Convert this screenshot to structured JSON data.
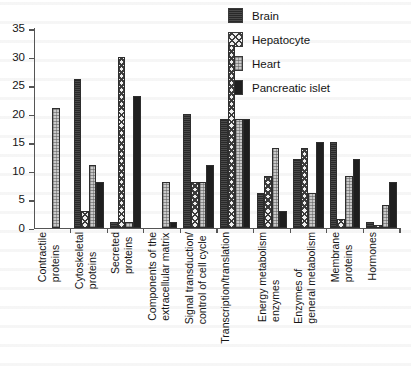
{
  "chart_data": {
    "type": "bar",
    "title": "",
    "subtitle": "",
    "xlabel": "",
    "ylabel": "",
    "ylim": [
      0,
      35
    ],
    "yticks": [
      0,
      5,
      10,
      15,
      20,
      25,
      30,
      35
    ],
    "grid": false,
    "legend_position": "top-right",
    "categories": [
      "Contractile proteins",
      "Cytoskeletal proteins",
      "Secreted proteins",
      "Components of the extracellular matrix",
      "Signal transduction/ control of cell cycle",
      "Transcription/translation",
      "Energy metabolism enzymes",
      "Enzymes of general metabolism",
      "Membrane proteins",
      "Hormones"
    ],
    "category_lines": [
      [
        "Contractile",
        "proteins"
      ],
      [
        "Cytoskeletal",
        "proteins"
      ],
      [
        "Secreted",
        "proteins"
      ],
      [
        "Components of the",
        "extracellular matrix"
      ],
      [
        "Signal transduction/",
        "control of cell cycle"
      ],
      [
        "Transcription/translation"
      ],
      [
        "Energy metabolism",
        "enzymes"
      ],
      [
        "Enzymes of",
        "general metabolism"
      ],
      [
        "Membrane",
        "proteins"
      ],
      [
        "Hormones"
      ]
    ],
    "series": [
      {
        "name": "Brain",
        "key": "brain",
        "color": "#4a4a4a",
        "pattern": "dark-gray-solid",
        "values": [
          0,
          26,
          1,
          0,
          20,
          19,
          6,
          12,
          15,
          1
        ]
      },
      {
        "name": "Hepatocyte",
        "key": "hepatocyte",
        "color": "#3c3c3c",
        "pattern": "cross-hatch",
        "values": [
          0,
          3,
          30,
          0,
          8,
          32,
          9,
          14,
          1.5,
          0.5
        ]
      },
      {
        "name": "Heart",
        "key": "heart",
        "color": "#c9c9c9",
        "pattern": "light-dotted",
        "values": [
          21,
          11,
          1,
          8,
          8,
          19,
          14,
          6,
          9,
          4
        ]
      },
      {
        "name": "Pancreatic islet",
        "key": "pancreatic",
        "color": "#1f1f1f",
        "pattern": "solid-black",
        "values": [
          0,
          8,
          23,
          1,
          11,
          19,
          3,
          15,
          12,
          8
        ]
      }
    ]
  },
  "legend": {
    "items": [
      {
        "label": "Brain"
      },
      {
        "label": "Hepatocyte"
      },
      {
        "label": "Heart"
      },
      {
        "label": "Pancreatic islet"
      }
    ]
  }
}
